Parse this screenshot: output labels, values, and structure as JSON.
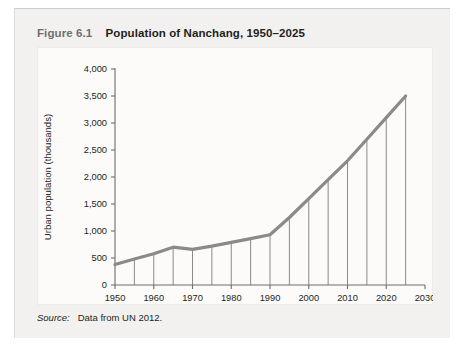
{
  "figure": {
    "number": "Figure 6.1",
    "title": "Population of Nanchang, 1950–2025",
    "source_label": "Source:",
    "source_text": "Data from UN 2012."
  },
  "colors": {
    "line": "#8a8a8a",
    "droplines": "#7d7d7d",
    "axis": "#6d6d6d",
    "text": "#231f20",
    "card_bg": "#f2f1ef",
    "plot_bg": "#fcfbfa"
  },
  "chart_data": {
    "type": "line",
    "title": "Population of Nanchang, 1950–2025",
    "xlabel": "",
    "ylabel": "Urban population (thousands)",
    "xlim": [
      1950,
      2030
    ],
    "ylim": [
      0,
      4000
    ],
    "grid": false,
    "legend": false,
    "xticks": [
      1950,
      1960,
      1970,
      1980,
      1990,
      2000,
      2010,
      2020,
      2030
    ],
    "xtick_labels": [
      "1950",
      "1960",
      "1970",
      "1980",
      "1990",
      "2000",
      "2010",
      "2020",
      "2030"
    ],
    "yticks": [
      0,
      500,
      1000,
      1500,
      2000,
      2500,
      3000,
      3500,
      4000
    ],
    "ytick_labels": [
      "0",
      "500",
      "1,000",
      "1,500",
      "2,000",
      "2,500",
      "3,000",
      "3,500",
      "4,000"
    ],
    "x": [
      1950,
      1955,
      1960,
      1965,
      1970,
      1975,
      1980,
      1985,
      1990,
      1995,
      2000,
      2005,
      2010,
      2015,
      2020,
      2025
    ],
    "values": [
      380,
      480,
      580,
      700,
      660,
      720,
      790,
      860,
      930,
      1250,
      1600,
      1950,
      2300,
      2700,
      3100,
      3500
    ],
    "droplines_at": [
      1955,
      1960,
      1965,
      1970,
      1975,
      1980,
      1985,
      1990,
      1995,
      2000,
      2005,
      2010,
      2015,
      2020,
      2025
    ],
    "annotations": []
  }
}
